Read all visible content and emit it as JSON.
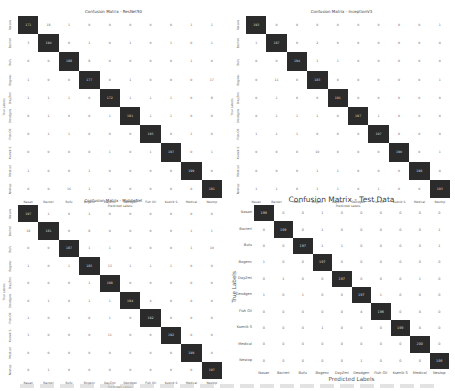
{
  "labels": [
    "Nasan",
    "Bacteri",
    "Bufu",
    "Bogenc",
    "DayZmi",
    "Deodgen",
    "Fish Oil",
    "Ksenik S",
    "Medical",
    "Nestop"
  ],
  "chart_data": [
    {
      "type": "heatmap",
      "title": "Confusion Matrix - ResNet50",
      "xlabel": "Predicted Labels",
      "ylabel": "True Labels",
      "matrix": [
        [
          171,
          18,
          1,
          0,
          0,
          0,
          0,
          0,
          1,
          1
        ],
        [
          3,
          190,
          0,
          1,
          0,
          1,
          0,
          1,
          0,
          1
        ],
        [
          0,
          0,
          188,
          8,
          0,
          0,
          0,
          0,
          1,
          0
        ],
        [
          1,
          0,
          0,
          177,
          0,
          1,
          0,
          0,
          0,
          17
        ],
        [
          1,
          1,
          1,
          0,
          172,
          1,
          1,
          1,
          0,
          8
        ],
        [
          0,
          1,
          0,
          0,
          1,
          191,
          1,
          1,
          0,
          0
        ],
        [
          0,
          1,
          1,
          0,
          0,
          0,
          195,
          0,
          1,
          0
        ],
        [
          0,
          0,
          0,
          0,
          1,
          0,
          1,
          197,
          0,
          1
        ],
        [
          1,
          0,
          0,
          1,
          0,
          0,
          0,
          0,
          199,
          0
        ],
        [
          0,
          0,
          16,
          1,
          0,
          0,
          0,
          0,
          0,
          181
        ]
      ]
    },
    {
      "type": "heatmap",
      "title": "Confusion Matrix - InceptionV3",
      "xlabel": "Predicted Labels",
      "ylabel": "True Labels",
      "matrix": [
        [
          193,
          0,
          0,
          0,
          0,
          0,
          0,
          0,
          0,
          1
        ],
        [
          1,
          187,
          0,
          2,
          0,
          0,
          0,
          0,
          0,
          0
        ],
        [
          0,
          0,
          194,
          1,
          1,
          0,
          0,
          0,
          0,
          0
        ],
        [
          0,
          11,
          0,
          183,
          0,
          0,
          0,
          0,
          0,
          1
        ],
        [
          0,
          1,
          0,
          0,
          191,
          0,
          0,
          0,
          0,
          0
        ],
        [
          0,
          1,
          1,
          1,
          0,
          197,
          1,
          0,
          0,
          0
        ],
        [
          1,
          1,
          1,
          0,
          0,
          0,
          197,
          0,
          0,
          0
        ],
        [
          0,
          0,
          0,
          10,
          0,
          0,
          0,
          190,
          0,
          1
        ],
        [
          0,
          0,
          0,
          1,
          1,
          0,
          0,
          0,
          198,
          0
        ],
        [
          1,
          1,
          0,
          1,
          1,
          0,
          1,
          0,
          0,
          193
        ]
      ]
    },
    {
      "type": "heatmap",
      "title": "Confusion Matrix - MobileNet",
      "xlabel": "Predicted Labels",
      "ylabel": "True Labels",
      "matrix": [
        [
          197,
          1,
          0,
          1,
          0,
          0,
          0,
          0,
          0,
          0
        ],
        [
          18,
          181,
          0,
          8,
          0,
          0,
          0,
          0,
          1,
          1
        ],
        [
          0,
          0,
          187,
          1,
          1,
          0,
          0,
          0,
          1,
          10
        ],
        [
          1,
          0,
          1,
          185,
          13,
          1,
          1,
          1,
          0,
          0
        ],
        [
          0,
          0,
          0,
          1,
          198,
          0,
          0,
          0,
          0,
          0
        ],
        [
          0,
          1,
          0,
          1,
          1,
          194,
          4,
          0,
          0,
          0
        ],
        [
          1,
          0,
          0,
          0,
          1,
          0,
          192,
          0,
          0,
          0
        ],
        [
          1,
          0,
          0,
          0,
          11,
          0,
          0,
          192,
          0,
          0
        ],
        [
          0,
          0,
          0,
          0,
          0,
          0,
          0,
          0,
          199,
          0
        ],
        [
          0,
          1,
          0,
          0,
          0,
          0,
          0,
          0,
          0,
          197
        ]
      ]
    },
    {
      "type": "heatmap",
      "title": "Confusion Matrix - Test Data",
      "xlabel": "Predicted Labels",
      "ylabel": "True Labels",
      "matrix": [
        [
          199,
          0,
          0,
          1,
          0,
          0,
          0,
          0,
          0,
          0
        ],
        [
          0,
          199,
          0,
          1,
          0,
          0,
          0,
          0,
          0,
          1
        ],
        [
          0,
          0,
          197,
          1,
          1,
          0,
          0,
          0,
          0,
          1
        ],
        [
          1,
          0,
          0,
          197,
          0,
          0,
          0,
          0,
          0,
          0
        ],
        [
          0,
          1,
          0,
          0,
          197,
          0,
          0,
          0,
          1,
          0
        ],
        [
          1,
          0,
          1,
          0,
          0,
          197,
          1,
          0,
          0,
          0
        ],
        [
          0,
          0,
          0,
          0,
          0,
          4,
          196,
          0,
          0,
          0
        ],
        [
          0,
          0,
          0,
          1,
          0,
          0,
          0,
          199,
          0,
          0
        ],
        [
          0,
          0,
          0,
          0,
          0,
          0,
          0,
          0,
          200,
          0
        ],
        [
          0,
          0,
          0,
          0,
          0,
          1,
          0,
          0,
          0,
          199
        ]
      ]
    }
  ]
}
